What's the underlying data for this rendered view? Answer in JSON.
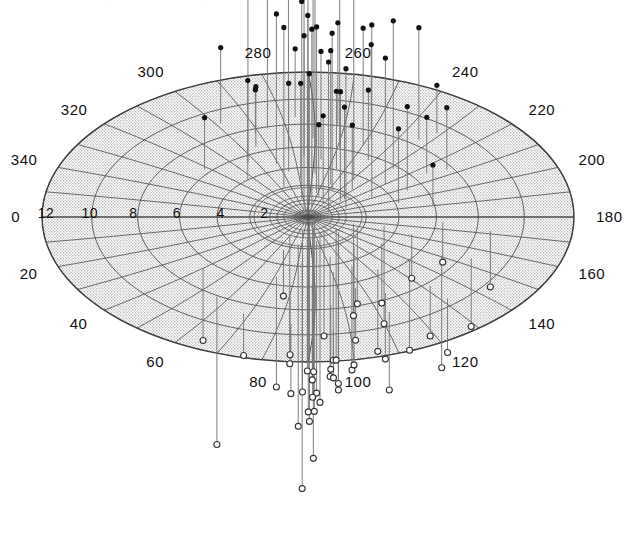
{
  "figure": {
    "type": "polar-stereographic-scatter",
    "background_color": "#ffffff",
    "shade_color": "#d8d8d8",
    "grid_color": "#4a4a4a",
    "stem_color": "#777777",
    "marker_fill_color": "#111111",
    "marker_open_color": "#ffffff",
    "top_artifact_text": "."
  },
  "projection": {
    "center_x": 308,
    "center_y": 217,
    "radius_x": 266,
    "radius_y": 145,
    "max_radial_value": 13,
    "azimuth_label_step": 20,
    "azimuth_ring_count": 8,
    "spoke_count": 36
  },
  "chart_data": {
    "type": "scatter",
    "title": "",
    "subtitle": "",
    "xlabel": "",
    "ylabel": "",
    "grid": true,
    "legend_position": "none",
    "azimuth_axis": {
      "label": "azimuth (degrees)",
      "unit": "deg",
      "range": [
        0,
        360
      ],
      "tick_step": 20,
      "tick_labels": [
        "0",
        "20",
        "40",
        "60",
        "80",
        "100",
        "120",
        "140",
        "160",
        "180",
        "200",
        "220",
        "240",
        "260",
        "280",
        "300",
        "320",
        "340"
      ]
    },
    "radial_axis": {
      "label": "radius",
      "range": [
        0,
        13
      ],
      "tick_step": 2,
      "tick_labels": [
        "2",
        "4",
        "6",
        "8",
        "10",
        "12"
      ],
      "direction": "outward"
    },
    "series": [
      {
        "name": "positive (filled, stem up)",
        "marker": "filled-circle",
        "stem_direction": "up",
        "points": [
          {
            "az": 301,
            "r": 5.7,
            "h": 175
          },
          {
            "az": 292,
            "r": 6.8,
            "h": 60
          },
          {
            "az": 288,
            "r": 5.0,
            "h": 150
          },
          {
            "az": 284,
            "r": 8.2,
            "h": 168
          },
          {
            "az": 283,
            "r": 4.2,
            "h": 88
          },
          {
            "az": 279,
            "r": 6.1,
            "h": 182
          },
          {
            "az": 276,
            "r": 3.4,
            "h": 96
          },
          {
            "az": 272,
            "r": 5.5,
            "h": 120
          },
          {
            "az": 270,
            "r": 2.8,
            "h": 205
          },
          {
            "az": 268,
            "r": 7.1,
            "h": 142
          },
          {
            "az": 265,
            "r": 3.9,
            "h": 190
          },
          {
            "az": 263,
            "r": 5.2,
            "h": 108
          },
          {
            "az": 259,
            "r": 2.2,
            "h": 166
          },
          {
            "az": 256,
            "r": 6.4,
            "h": 210
          },
          {
            "az": 252,
            "r": 4.5,
            "h": 78
          },
          {
            "az": 249,
            "r": 3.1,
            "h": 134
          },
          {
            "az": 246,
            "r": 7.6,
            "h": 95
          },
          {
            "az": 243,
            "r": 2.6,
            "h": 158
          },
          {
            "az": 240,
            "r": 5.9,
            "h": 70
          },
          {
            "az": 236,
            "r": 4.0,
            "h": 186
          },
          {
            "az": 232,
            "r": 8.8,
            "h": 112
          },
          {
            "az": 229,
            "r": 3.3,
            "h": 64
          },
          {
            "az": 226,
            "r": 6.0,
            "h": 148
          },
          {
            "az": 222,
            "r": 2.4,
            "h": 92
          },
          {
            "az": 218,
            "r": 4.8,
            "h": 126
          },
          {
            "az": 214,
            "r": 7.0,
            "h": 56
          },
          {
            "az": 210,
            "r": 3.6,
            "h": 172
          },
          {
            "az": 206,
            "r": 5.4,
            "h": 84
          },
          {
            "az": 202,
            "r": 2.0,
            "h": 140
          },
          {
            "az": 312,
            "r": 4.4,
            "h": 100
          },
          {
            "az": 320,
            "r": 6.6,
            "h": 52
          },
          {
            "az": 297,
            "r": 9.4,
            "h": 76
          },
          {
            "az": 294,
            "r": 2.9,
            "h": 160
          },
          {
            "az": 289,
            "r": 7.9,
            "h": 44
          },
          {
            "az": 281,
            "r": 1.6,
            "h": 198
          },
          {
            "az": 274,
            "r": 9.0,
            "h": 68
          },
          {
            "az": 267,
            "r": 1.2,
            "h": 130
          },
          {
            "az": 260,
            "r": 8.4,
            "h": 102
          },
          {
            "az": 254,
            "r": 1.9,
            "h": 72
          },
          {
            "az": 247,
            "r": 6.9,
            "h": 118
          },
          {
            "az": 238,
            "r": 1.4,
            "h": 88
          },
          {
            "az": 230,
            "r": 9.8,
            "h": 48
          },
          {
            "az": 221,
            "r": 2.1,
            "h": 110
          },
          {
            "az": 212,
            "r": 8.0,
            "h": 62
          },
          {
            "az": 204,
            "r": 1.1,
            "h": 150
          },
          {
            "az": 196,
            "r": 4.6,
            "h": 74
          },
          {
            "az": 190,
            "r": 6.2,
            "h": 40
          },
          {
            "az": 286,
            "r": 0.7,
            "h": 212
          },
          {
            "az": 271,
            "r": 0.5,
            "h": 196
          },
          {
            "az": 258,
            "r": 0.9,
            "h": 178
          }
        ]
      },
      {
        "name": "negative (open, stem down)",
        "marker": "open-circle",
        "stem_direction": "down",
        "points": [
          {
            "az": 42,
            "r": 6.9,
            "h": 72
          },
          {
            "az": 58,
            "r": 8.4,
            "h": 148
          },
          {
            "az": 68,
            "r": 3.2,
            "h": 46
          },
          {
            "az": 74,
            "r": 5.6,
            "h": 110
          },
          {
            "az": 79,
            "r": 2.5,
            "h": 182
          },
          {
            "az": 83,
            "r": 7.2,
            "h": 58
          },
          {
            "az": 86,
            "r": 4.1,
            "h": 226
          },
          {
            "az": 89,
            "r": 1.8,
            "h": 134
          },
          {
            "az": 92,
            "r": 6.0,
            "h": 96
          },
          {
            "az": 95,
            "r": 3.0,
            "h": 208
          },
          {
            "az": 98,
            "r": 8.0,
            "h": 64
          },
          {
            "az": 101,
            "r": 2.2,
            "h": 152
          },
          {
            "az": 104,
            "r": 5.1,
            "h": 88
          },
          {
            "az": 107,
            "r": 3.7,
            "h": 120
          },
          {
            "az": 110,
            "r": 6.8,
            "h": 52
          },
          {
            "az": 113,
            "r": 1.5,
            "h": 170
          },
          {
            "az": 116,
            "r": 4.9,
            "h": 104
          },
          {
            "az": 119,
            "r": 7.8,
            "h": 66
          },
          {
            "az": 122,
            "r": 2.8,
            "h": 140
          },
          {
            "az": 126,
            "r": 5.8,
            "h": 82
          },
          {
            "az": 130,
            "r": 3.5,
            "h": 118
          },
          {
            "az": 134,
            "r": 8.6,
            "h": 50
          },
          {
            "az": 138,
            "r": 2.0,
            "h": 158
          },
          {
            "az": 142,
            "r": 6.3,
            "h": 90
          },
          {
            "az": 147,
            "r": 4.3,
            "h": 60
          },
          {
            "az": 152,
            "r": 7.4,
            "h": 112
          },
          {
            "az": 158,
            "r": 2.6,
            "h": 76
          },
          {
            "az": 163,
            "r": 5.3,
            "h": 44
          },
          {
            "az": 168,
            "r": 3.8,
            "h": 98
          },
          {
            "az": 172,
            "r": 9.0,
            "h": 56
          },
          {
            "az": 62,
            "r": 1.9,
            "h": 128
          },
          {
            "az": 70,
            "r": 9.2,
            "h": 42
          },
          {
            "az": 77,
            "r": 1.2,
            "h": 162
          },
          {
            "az": 85,
            "r": 9.6,
            "h": 70
          },
          {
            "az": 91,
            "r": 0.8,
            "h": 186
          },
          {
            "az": 97,
            "r": 10.2,
            "h": 48
          },
          {
            "az": 106,
            "r": 1.0,
            "h": 144
          },
          {
            "az": 115,
            "r": 9.4,
            "h": 78
          },
          {
            "az": 124,
            "r": 1.4,
            "h": 106
          },
          {
            "az": 133,
            "r": 10.0,
            "h": 54
          },
          {
            "az": 144,
            "r": 1.7,
            "h": 132
          },
          {
            "az": 155,
            "r": 8.8,
            "h": 68
          },
          {
            "az": 165,
            "r": 2.3,
            "h": 92
          },
          {
            "az": 176,
            "r": 6.6,
            "h": 40
          },
          {
            "az": 100,
            "r": 0.4,
            "h": 200
          },
          {
            "az": 112,
            "r": 0.6,
            "h": 174
          },
          {
            "az": 128,
            "r": 0.5,
            "h": 190
          }
        ]
      }
    ]
  }
}
